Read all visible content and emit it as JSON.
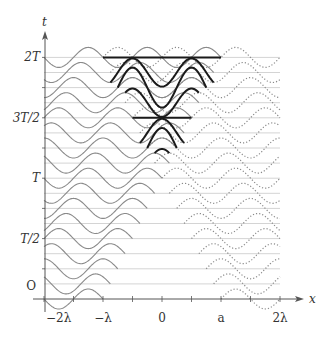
{
  "figure": {
    "axes": {
      "x_label": "x",
      "y_label": "t",
      "x_ticks": [
        {
          "label": "−2λ",
          "value": -2
        },
        {
          "label": "−λ",
          "value": -1
        },
        {
          "label": "0",
          "value": 0
        },
        {
          "label": "a",
          "value": 1
        },
        {
          "label": "2λ",
          "value": 2
        }
      ],
      "y_ticks": [
        {
          "label": "O",
          "value": 0
        },
        {
          "label": "T/2",
          "value": 0.5
        },
        {
          "label": "T",
          "value": 1
        },
        {
          "label": "3T/2",
          "value": 1.5
        },
        {
          "label": "2T",
          "value": 2
        }
      ]
    },
    "colors": {
      "axis": "#555555",
      "baseline": "#d4d4d4",
      "incident": "#8a8a8a",
      "reflected": "#8a8a8a",
      "standing": "#1a1a1a"
    }
  },
  "chart_data": {
    "type": "line",
    "title": "",
    "xlabel": "x",
    "ylabel": "t",
    "x_units": "wavelength λ",
    "xlim": [
      -2,
      2
    ],
    "ylim": [
      0,
      2
    ],
    "rows": 17,
    "row_step_T": 0.125,
    "amplitude_rel": 0.17,
    "series": [
      {
        "name": "incident wave (solid, from left)",
        "start": -2,
        "front_at_t0": -1,
        "front_speed_per_row": 0.125
      },
      {
        "name": "reflected wave (dotted, from right)",
        "end": 2,
        "front_at_t0": 1,
        "front_speed_per_row": -0.125
      },
      {
        "name": "superposition / standing wave (bold)",
        "region": "between fronts after overlap",
        "nodes_flat_rows_T": [
          1.5,
          2
        ]
      }
    ],
    "grid": false,
    "legend": "none"
  }
}
